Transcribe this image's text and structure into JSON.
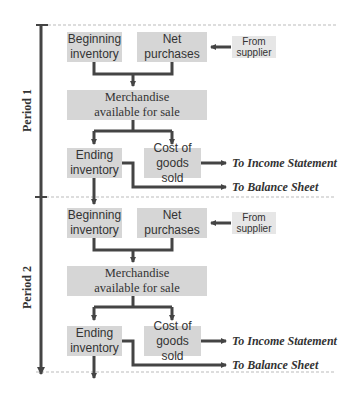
{
  "diagram": {
    "type": "inventory-flow",
    "colors": {
      "box_fill": "#d6d6d6",
      "source_fill": "#e6e6e6",
      "arrow": "#444444",
      "text": "#333333",
      "divider": "#bbbbbb"
    },
    "periods": [
      {
        "label": "Period 1",
        "beginning_inventory": "Beginning\ninventory",
        "net_purchases": "Net\npurchases",
        "source": "From\nsupplier",
        "merchandise": "Merchandise\navailable for sale",
        "ending_inventory": "Ending\ninventory",
        "cogs": "Cost of\ngoods sold",
        "to_income": "To Income Statement",
        "to_balance": "To Balance Sheet"
      },
      {
        "label": "Period 2",
        "beginning_inventory": "Beginning\ninventory",
        "net_purchases": "Net\npurchases",
        "source": "From\nsupplier",
        "merchandise": "Merchandise\navailable for sale",
        "ending_inventory": "Ending\ninventory",
        "cogs": "Cost of\ngoods sold",
        "to_income": "To Income Statement",
        "to_balance": "To Balance Sheet"
      }
    ]
  }
}
